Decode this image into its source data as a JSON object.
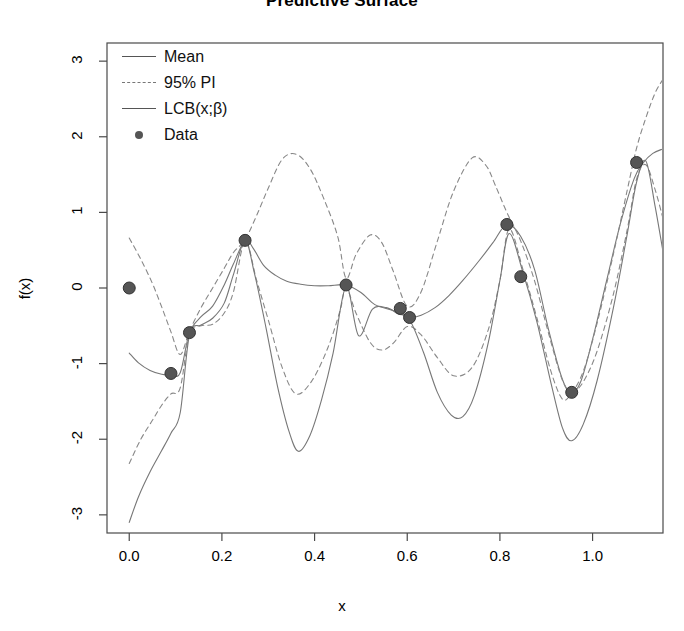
{
  "chart_data": {
    "type": "line",
    "title": "Predictive Surface",
    "xlabel": "x",
    "ylabel": "f(x)",
    "xlim": [
      -0.048,
      1.152
    ],
    "ylim": [
      -3.24,
      3.24
    ],
    "xticks": [
      "0.0",
      "0.2",
      "0.4",
      "0.6",
      "0.8",
      "1.0"
    ],
    "xtick_values": [
      0.0,
      0.2,
      0.4,
      0.6,
      0.8,
      1.0
    ],
    "yticks": [
      "3",
      "2",
      "1",
      "0",
      "-1",
      "-2",
      "-3"
    ],
    "ytick_values": [
      3,
      2,
      1,
      0,
      -1,
      -2,
      -3
    ],
    "grid": false,
    "legend_position": "top-left",
    "legend": [
      {
        "label": "Mean",
        "style": "solid-line",
        "color": "#555555"
      },
      {
        "label": "95% PI",
        "style": "dashed-line",
        "color": "#777777"
      },
      {
        "label": "LCB(x;β)",
        "style": "solid-line",
        "color": "#555555"
      },
      {
        "label": "Data",
        "style": "point",
        "color": "#555555"
      }
    ],
    "series": [
      {
        "name": "Mean",
        "style": "solid",
        "color": "#777777",
        "x": [
          0.0,
          0.02,
          0.045,
          0.07,
          0.09,
          0.11,
          0.13,
          0.155,
          0.18,
          0.205,
          0.225,
          0.25,
          0.268,
          0.29,
          0.315,
          0.34,
          0.37,
          0.4,
          0.43,
          0.468,
          0.5,
          0.53,
          0.56,
          0.585,
          0.605,
          0.63,
          0.66,
          0.69,
          0.72,
          0.755,
          0.785,
          0.815,
          0.845,
          0.875,
          0.905,
          0.935,
          0.955,
          0.975,
          1.0,
          1.03,
          1.06,
          1.09,
          1.11,
          1.13,
          1.152
        ],
        "y": [
          -0.86,
          -0.99,
          -1.09,
          -1.14,
          -1.15,
          -1.12,
          -0.59,
          -0.38,
          -0.24,
          0.04,
          0.32,
          0.63,
          0.52,
          0.3,
          0.17,
          0.09,
          0.05,
          0.03,
          0.03,
          0.04,
          -0.06,
          -0.22,
          -0.28,
          -0.33,
          -0.39,
          -0.36,
          -0.26,
          -0.1,
          0.1,
          0.36,
          0.6,
          0.84,
          0.68,
          0.24,
          -0.55,
          -1.21,
          -1.38,
          -1.23,
          -0.68,
          0.09,
          0.85,
          1.45,
          1.66,
          1.78,
          1.84
        ]
      },
      {
        "name": "95% PI Upper",
        "style": "dashed",
        "color": "#888888",
        "x": [
          0.0,
          0.025,
          0.05,
          0.07,
          0.09,
          0.11,
          0.13,
          0.155,
          0.18,
          0.205,
          0.225,
          0.25,
          0.275,
          0.3,
          0.33,
          0.36,
          0.39,
          0.42,
          0.45,
          0.468,
          0.49,
          0.52,
          0.545,
          0.57,
          0.6,
          0.63,
          0.665,
          0.7,
          0.74,
          0.77,
          0.79,
          0.815,
          0.845,
          0.875,
          0.905,
          0.935,
          0.955,
          0.98,
          1.01,
          1.045,
          1.075,
          1.095,
          1.115,
          1.135,
          1.152
        ],
        "y": [
          0.66,
          0.38,
          0.06,
          -0.25,
          -0.58,
          -0.88,
          -0.57,
          -0.26,
          0.0,
          0.26,
          0.47,
          0.64,
          0.96,
          1.32,
          1.7,
          1.77,
          1.58,
          1.18,
          0.68,
          0.13,
          0.45,
          0.7,
          0.6,
          0.22,
          -0.24,
          -0.05,
          0.62,
          1.28,
          1.72,
          1.62,
          1.36,
          1.0,
          0.62,
          0.09,
          -0.6,
          -1.22,
          -1.36,
          -1.1,
          -0.46,
          0.45,
          1.3,
          1.85,
          2.25,
          2.58,
          2.76
        ]
      },
      {
        "name": "95% PI Lower",
        "style": "dashed",
        "color": "#888888",
        "x": [
          0.0,
          0.025,
          0.05,
          0.07,
          0.09,
          0.11,
          0.13,
          0.155,
          0.18,
          0.205,
          0.225,
          0.25,
          0.275,
          0.3,
          0.33,
          0.36,
          0.395,
          0.43,
          0.455,
          0.468,
          0.49,
          0.52,
          0.545,
          0.57,
          0.6,
          0.63,
          0.665,
          0.7,
          0.74,
          0.775,
          0.8,
          0.82,
          0.85,
          0.88,
          0.91,
          0.935,
          0.955,
          0.98,
          1.01,
          1.045,
          1.075,
          1.095,
          1.115,
          1.135,
          1.152
        ],
        "y": [
          -2.32,
          -2.0,
          -1.75,
          -1.55,
          -1.4,
          -1.32,
          -0.61,
          -0.5,
          -0.48,
          -0.33,
          -0.05,
          0.62,
          0.1,
          -0.42,
          -1.05,
          -1.4,
          -1.22,
          -0.77,
          -0.3,
          0.0,
          -0.34,
          -0.72,
          -0.82,
          -0.73,
          -0.51,
          -0.62,
          -0.92,
          -1.16,
          -1.05,
          -0.55,
          0.1,
          0.78,
          0.24,
          -0.4,
          -1.1,
          -1.47,
          -1.4,
          -1.24,
          -0.83,
          -0.08,
          0.78,
          1.44,
          1.63,
          1.3,
          0.92
        ]
      },
      {
        "name": "LCB(x;β)",
        "style": "solid",
        "color": "#777777",
        "x": [
          0.0,
          0.02,
          0.045,
          0.07,
          0.09,
          0.11,
          0.13,
          0.155,
          0.18,
          0.205,
          0.225,
          0.25,
          0.27,
          0.295,
          0.32,
          0.345,
          0.365,
          0.39,
          0.415,
          0.44,
          0.468,
          0.495,
          0.525,
          0.555,
          0.58,
          0.605,
          0.635,
          0.665,
          0.695,
          0.72,
          0.745,
          0.775,
          0.8,
          0.82,
          0.85,
          0.88,
          0.91,
          0.935,
          0.955,
          0.98,
          1.01,
          1.045,
          1.075,
          1.095,
          1.115,
          1.135,
          1.152
        ],
        "y": [
          -3.1,
          -2.76,
          -2.43,
          -2.15,
          -1.92,
          -1.65,
          -0.62,
          -0.49,
          -0.4,
          -0.2,
          0.18,
          0.63,
          0.2,
          -0.52,
          -1.3,
          -1.9,
          -2.16,
          -1.95,
          -1.48,
          -0.86,
          0.02,
          -0.63,
          -0.28,
          -0.26,
          -0.34,
          -0.42,
          -0.85,
          -1.38,
          -1.68,
          -1.7,
          -1.42,
          -0.72,
          0.1,
          0.72,
          0.2,
          -0.45,
          -1.25,
          -1.85,
          -2.02,
          -1.8,
          -1.22,
          -0.26,
          0.72,
          1.4,
          1.68,
          1.08,
          0.48
        ]
      }
    ],
    "points": {
      "name": "Data",
      "color": "#555555",
      "x": [
        0.0,
        0.09,
        0.13,
        0.25,
        0.468,
        0.585,
        0.605,
        0.815,
        0.845,
        0.955,
        1.095
      ],
      "y": [
        0.0,
        -1.13,
        -0.59,
        0.63,
        0.04,
        -0.27,
        -0.39,
        0.84,
        0.15,
        -1.38,
        1.66
      ]
    }
  }
}
